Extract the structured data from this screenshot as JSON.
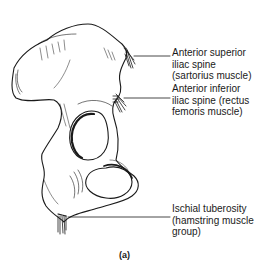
{
  "figure": {
    "caption": "(a)"
  },
  "labels": [
    {
      "id": "asis",
      "lines": [
        "Anterior superior",
        "iliac spine",
        "(sartorius muscle)"
      ]
    },
    {
      "id": "aiis",
      "lines": [
        "Anterior inferior",
        "iliac spine (rectus",
        "femoris muscle)"
      ]
    },
    {
      "id": "ischial",
      "lines": [
        "Ischial tuberosity",
        "(hamstring muscle",
        "group)"
      ]
    }
  ]
}
